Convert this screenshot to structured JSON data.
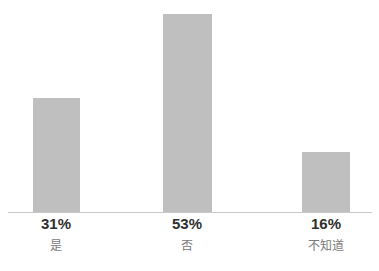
{
  "chart_data": {
    "type": "bar",
    "title": "",
    "subtitle": "",
    "xlabel": "",
    "ylabel": "",
    "categories": [
      "是",
      "否",
      "不知道"
    ],
    "values": [
      31,
      53,
      16
    ],
    "value_labels": [
      "31%",
      "53%",
      "16%"
    ],
    "ylim": [
      0,
      57
    ],
    "grid": false,
    "legend": false,
    "legend_position": "none",
    "bar_color": "#bfbfbf",
    "axis_color": "#c8c8c8",
    "value_label_color": "#2f2f2f",
    "category_label_color": "#7a7a7a",
    "bars": [
      {
        "category": "是",
        "value": 31,
        "value_label": "31%",
        "left_px": 33,
        "width_px": 47,
        "height_px": 115,
        "center_px": 56
      },
      {
        "category": "否",
        "value": 53,
        "value_label": "53%",
        "left_px": 163,
        "width_px": 49,
        "height_px": 199,
        "center_px": 187
      },
      {
        "category": "不知道",
        "value": 16,
        "value_label": "16%",
        "left_px": 302,
        "width_px": 48,
        "height_px": 61,
        "center_px": 326
      }
    ]
  }
}
